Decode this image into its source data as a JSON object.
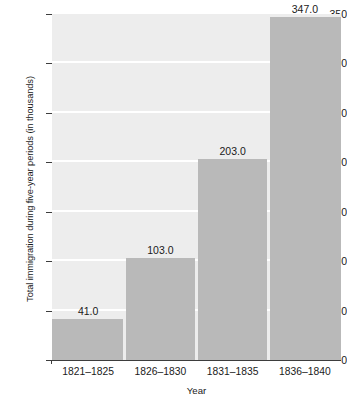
{
  "chart_data": {
    "type": "bar",
    "title": "",
    "xlabel": "Year",
    "ylabel": "Total immigration during five-year periods (in thousands)",
    "categories": [
      "1821–1825",
      "1826–1830",
      "1831–1835",
      "1836–1840"
    ],
    "values": [
      41.0,
      103.0,
      203.0,
      347.0
    ],
    "value_labels": [
      "41.0",
      "103.0",
      "203.0",
      "347.0"
    ],
    "ylim": [
      0,
      350
    ],
    "ytick_values": [
      0,
      50,
      100,
      150,
      200,
      250,
      300,
      350
    ],
    "ytick_labels": [
      "0",
      "50",
      "100",
      "150",
      "200",
      "250",
      "300",
      "350"
    ],
    "gridlines": [
      50,
      100,
      150,
      200,
      250,
      300
    ],
    "grid": true,
    "grid_color": "#ffffff",
    "legend": null,
    "legend_position": "none",
    "colors": {
      "bar_fill": "#b9b9b9",
      "plot_background": "#ededed",
      "figure_background": "#ffffff",
      "axis_line": "#3d3d3d",
      "text": "#1a1a1a"
    }
  }
}
